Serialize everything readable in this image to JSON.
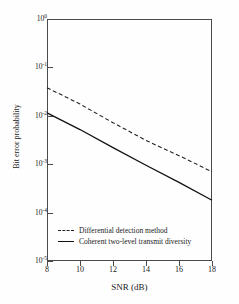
{
  "chart_data": {
    "type": "line",
    "title": "",
    "xlabel": "SNR (dB)",
    "ylabel": "Bit error probability",
    "xlim": [
      8,
      18
    ],
    "ylim": [
      1e-05,
      1
    ],
    "yscale": "log",
    "grid": false,
    "legend_position": "lower-left-inside",
    "xticks": [
      8,
      10,
      12,
      14,
      16,
      18
    ],
    "xtick_labels": [
      "8",
      "10",
      "12",
      "14",
      "16",
      "18"
    ],
    "yticks": [
      1,
      0.1,
      0.01,
      0.001,
      0.0001,
      1e-05
    ],
    "ytick_labels": [
      "10",
      "10",
      "10",
      "10",
      "10",
      "10"
    ],
    "ytick_exponents": [
      "0",
      "-1",
      "-2",
      "-3",
      "-4",
      "-5"
    ],
    "x": [
      8,
      10,
      12,
      14,
      16,
      18
    ],
    "series": [
      {
        "name": "Differential detection method",
        "style": "dashed",
        "color": "#222222",
        "values": [
          0.038,
          0.0175,
          0.0072,
          0.0031,
          0.0015,
          0.0007
        ]
      },
      {
        "name": "Coherent two-level transmit diversity",
        "style": "solid",
        "color": "#111111",
        "values": [
          0.0115,
          0.0052,
          0.0022,
          0.00095,
          0.00042,
          0.00018
        ]
      }
    ]
  },
  "axes": {
    "x_title": "SNR (dB)",
    "y_title": "Bit error probability"
  },
  "legend": {
    "items": [
      {
        "label": "Differential detection method",
        "style": "dashed"
      },
      {
        "label": "Coherent two-level transmit diversity",
        "style": "solid"
      }
    ]
  }
}
